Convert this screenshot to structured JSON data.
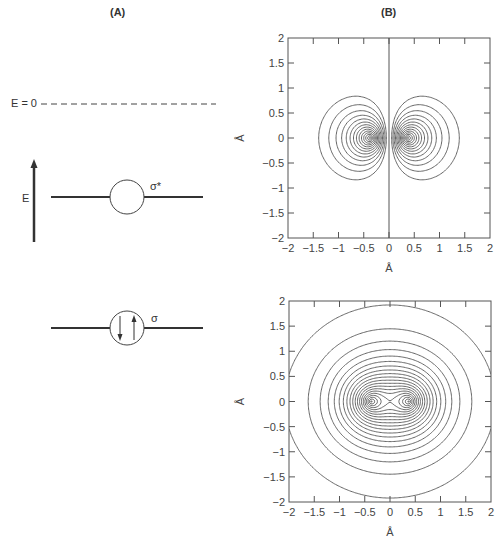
{
  "panels": {
    "a_label": "(A)",
    "b_label": "(B)"
  },
  "energy_diagram": {
    "zero_label": "E = 0",
    "axis_label": "E",
    "levels": [
      {
        "name": "antibonding",
        "label": "σ*",
        "occupancy": 0
      },
      {
        "name": "bonding",
        "label": "σ",
        "occupancy": 2,
        "electrons": [
          "down",
          "up"
        ]
      }
    ]
  },
  "colors": {
    "line": "#3a3a3a",
    "contour": "#555555",
    "background": "#ffffff"
  },
  "chart_data": [
    {
      "type": "contour",
      "title": "σ* antibonding orbital",
      "xlabel": "Å",
      "ylabel": "Å",
      "xlim": [
        -2,
        2
      ],
      "ylim": [
        -2,
        2
      ],
      "xticks": [
        "−2",
        "−1.5",
        "−1",
        "−0.5",
        "0",
        "0.5",
        "1",
        "1.5",
        "2"
      ],
      "yticks": [
        "2",
        "1.5",
        "1",
        "0.5",
        "0",
        "−0.5",
        "−1",
        "−1.5",
        "−2"
      ],
      "nuclei_x": [
        -0.37,
        0.37
      ],
      "function": "antisymmetric",
      "nodal_plane_x": 0,
      "contour_levels": 14
    },
    {
      "type": "contour",
      "title": "σ bonding orbital",
      "xlabel": "Å",
      "ylabel": "Å",
      "xlim": [
        -2,
        2
      ],
      "ylim": [
        -2,
        2
      ],
      "xticks": [
        "−2",
        "−1.5",
        "−1",
        "−0.5",
        "0",
        "0.5",
        "1",
        "1.5",
        "2"
      ],
      "yticks": [
        "2",
        "1.5",
        "1",
        "0.5",
        "0",
        "−0.5",
        "−1",
        "−1.5",
        "−2"
      ],
      "nuclei_x": [
        -0.37,
        0.37
      ],
      "function": "symmetric",
      "contour_levels": 20
    }
  ]
}
